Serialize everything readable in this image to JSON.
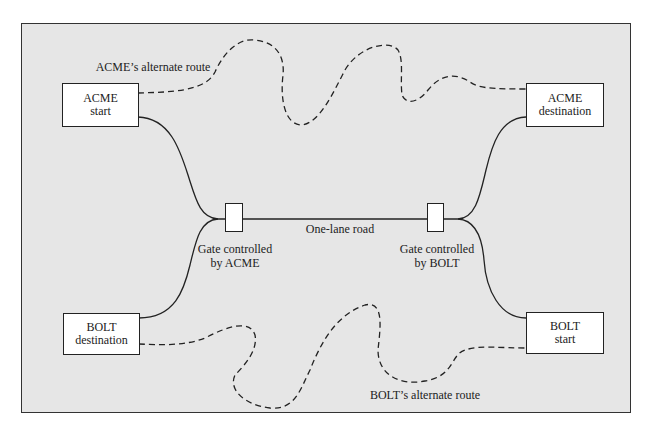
{
  "diagram": {
    "nodes": {
      "acme_start": {
        "line1": "ACME",
        "line2": "start"
      },
      "acme_destination": {
        "line1": "ACME",
        "line2": "destination"
      },
      "bolt_destination": {
        "line1": "BOLT",
        "line2": "destination"
      },
      "bolt_start": {
        "line1": "BOLT",
        "line2": "start"
      }
    },
    "gates": {
      "acme": {
        "line1": "Gate controlled",
        "line2": "by ACME"
      },
      "bolt": {
        "line1": "Gate controlled",
        "line2": "by BOLT"
      }
    },
    "edges": {
      "road_label": "One-lane road",
      "acme_alt_route": "ACME’s alternate route",
      "bolt_alt_route": "BOLT’s alternate route"
    },
    "colors": {
      "background": "#e6e6e6",
      "box_fill": "#ffffff",
      "stroke": "#222222"
    }
  }
}
